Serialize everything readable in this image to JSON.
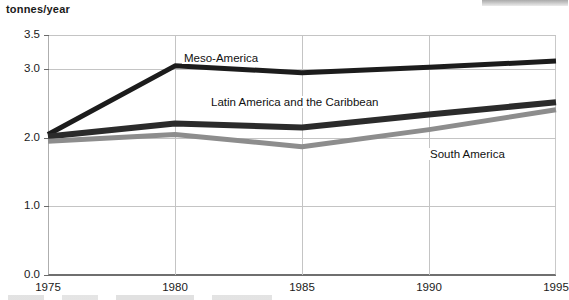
{
  "axis_title": "tonnes/year",
  "chart_data": {
    "type": "line",
    "title": "",
    "subtitle": "",
    "xlabel": "",
    "ylabel": "tonnes/year",
    "x": [
      1975,
      1980,
      1985,
      1990,
      1995
    ],
    "xtick_labels": [
      "1975",
      "1980",
      "1985",
      "1990",
      "1995"
    ],
    "xlim": [
      1975,
      1995
    ],
    "ytick_labels": [
      "0.0",
      "1.0",
      "2.0",
      "3.0",
      "3.5"
    ],
    "ytick_values": [
      0.0,
      1.0,
      2.0,
      3.0,
      3.5
    ],
    "ylim": [
      0.0,
      3.5
    ],
    "grid": true,
    "legend_position": "inline-labels",
    "series": [
      {
        "name": "Meso-America",
        "color": "#1c1c1c",
        "width": 5,
        "values": [
          2.05,
          3.05,
          2.95,
          3.03,
          3.12
        ]
      },
      {
        "name": "Latin America and  the Caribbean",
        "color": "#2b2b2b",
        "width": 6,
        "values": [
          2.02,
          2.21,
          2.15,
          2.34,
          2.52
        ]
      },
      {
        "name": "South America",
        "color": "#8d8d8d",
        "width": 5,
        "values": [
          1.95,
          2.05,
          1.87,
          2.12,
          2.41
        ]
      }
    ]
  }
}
